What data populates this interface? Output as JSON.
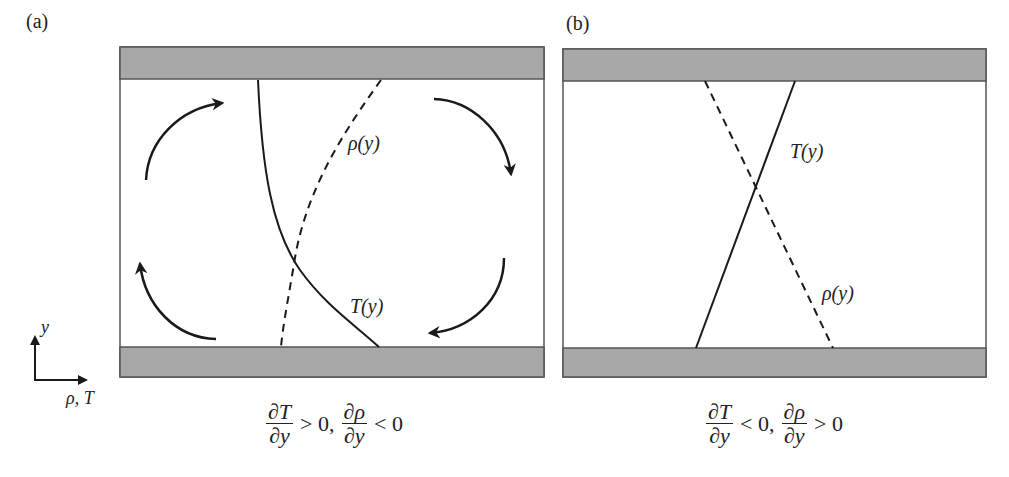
{
  "figure": {
    "panels": [
      {
        "id": "a",
        "tag": "(a)",
        "curve_labels": {
          "rho": "ρ(y)",
          "T": "T(y)"
        },
        "condition": {
          "frac1_num": "∂T",
          "frac1_den": "∂y",
          "rel1": "> 0,",
          "frac2_num": "∂ρ",
          "frac2_den": "∂y",
          "rel2": "< 0"
        },
        "description": "Temperature decreases upward (curved), density increases upward; convection cells shown by four curved arrows"
      },
      {
        "id": "b",
        "tag": "(b)",
        "curve_labels": {
          "rho": "ρ(y)",
          "T": "T(y)"
        },
        "condition": {
          "frac1_num": "∂T",
          "frac1_den": "∂y",
          "rel1": "< 0,",
          "frac2_num": "∂ρ",
          "frac2_den": "∂y",
          "rel2": "> 0"
        },
        "description": "Linear T(y) solid line and linear ρ(y) dashed line crossing; stable, no convection arrows"
      }
    ],
    "axes": {
      "y_label": "y",
      "x_label": "ρ, T"
    },
    "colors": {
      "plate_fill": "#a8a8a8",
      "plate_border": "#555555",
      "line": "#1a1a1a",
      "background": "#ffffff"
    }
  }
}
